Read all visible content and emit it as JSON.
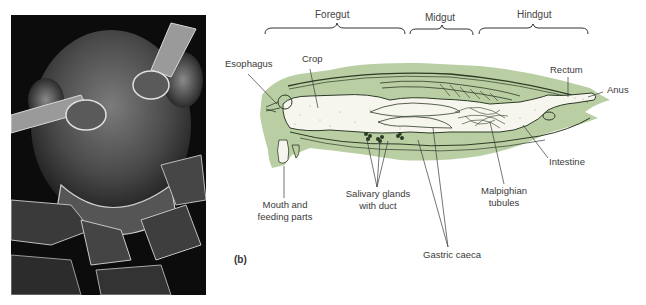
{
  "panel_label": "(b)",
  "photo": {
    "description": "scanning electron micrograph of insect head",
    "icon": "insect-head-photo"
  },
  "sections": [
    {
      "id": "foregut",
      "label": "Foregut"
    },
    {
      "id": "midgut",
      "label": "Midgut"
    },
    {
      "id": "hindgut",
      "label": "Hindgut"
    }
  ],
  "labels": {
    "esophagus": "Esophagus",
    "crop": "Crop",
    "rectum": "Rectum",
    "anus": "Anus",
    "intestine": "Intestine",
    "mouth_line1": "Mouth and",
    "mouth_line2": "feeding parts",
    "salivary_line1": "Salivary glands",
    "salivary_line2": "with duct",
    "malpighian_line1": "Malpighian",
    "malpighian_line2": "tubules",
    "gastric_caeca": "Gastric caeca"
  },
  "colors": {
    "body_green": "#b9cfa3",
    "gut_fill": "#f7f6ee",
    "line": "#2d3a26"
  }
}
